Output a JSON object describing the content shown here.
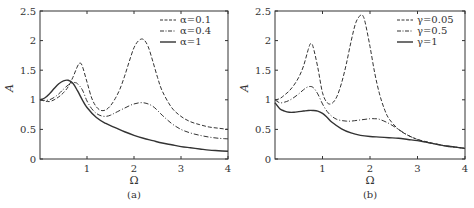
{
  "chart_data": [
    {
      "type": "line",
      "panel": "a",
      "caption": "(a)",
      "xlabel": "Ω",
      "ylabel": "A",
      "xlim": [
        0,
        4
      ],
      "ylim": [
        0,
        2.5
      ],
      "xticks": [
        "1",
        "2",
        "3",
        "4"
      ],
      "yticks": [
        "0",
        "0.5",
        "1",
        "1.5",
        "2",
        "2.5"
      ],
      "grid": false,
      "legend_position": "upper right",
      "series": [
        {
          "name": "α=0.1",
          "style": "dashed",
          "x": [
            0,
            0.1,
            0.2,
            0.3,
            0.4,
            0.5,
            0.6,
            0.7,
            0.8,
            0.85,
            0.9,
            1.0,
            1.1,
            1.2,
            1.3,
            1.4,
            1.5,
            1.6,
            1.7,
            1.8,
            1.9,
            2.0,
            2.1,
            2.2,
            2.3,
            2.4,
            2.5,
            2.6,
            2.8,
            3.0,
            3.2,
            3.4,
            3.6,
            3.8,
            4.0
          ],
          "y": [
            1.0,
            0.98,
            0.97,
            1.0,
            1.05,
            1.12,
            1.22,
            1.38,
            1.57,
            1.62,
            1.57,
            1.3,
            1.03,
            0.88,
            0.82,
            0.83,
            0.9,
            1.02,
            1.18,
            1.4,
            1.65,
            1.88,
            2.0,
            2.02,
            1.9,
            1.65,
            1.38,
            1.15,
            0.87,
            0.72,
            0.63,
            0.58,
            0.54,
            0.52,
            0.5
          ]
        },
        {
          "name": "α=0.4",
          "style": "dashdot",
          "x": [
            0,
            0.1,
            0.2,
            0.3,
            0.4,
            0.5,
            0.6,
            0.7,
            0.75,
            0.8,
            0.9,
            1.0,
            1.1,
            1.2,
            1.3,
            1.4,
            1.5,
            1.6,
            1.8,
            2.0,
            2.2,
            2.4,
            2.6,
            2.8,
            3.0,
            3.2,
            3.4,
            3.6,
            3.8,
            4.0
          ],
          "y": [
            1.0,
            0.99,
            1.0,
            1.04,
            1.1,
            1.18,
            1.25,
            1.29,
            1.29,
            1.27,
            1.17,
            0.98,
            0.85,
            0.77,
            0.73,
            0.72,
            0.74,
            0.78,
            0.86,
            0.93,
            0.95,
            0.89,
            0.74,
            0.6,
            0.5,
            0.44,
            0.4,
            0.37,
            0.35,
            0.34
          ]
        },
        {
          "name": "α=1",
          "style": "solid",
          "x": [
            0,
            0.1,
            0.2,
            0.3,
            0.4,
            0.5,
            0.6,
            0.7,
            0.8,
            0.9,
            1.0,
            1.2,
            1.4,
            1.6,
            1.8,
            2.0,
            2.2,
            2.4,
            2.6,
            2.8,
            3.0,
            3.2,
            3.4,
            3.6,
            3.8,
            4.0
          ],
          "y": [
            1.0,
            1.03,
            1.1,
            1.19,
            1.27,
            1.32,
            1.33,
            1.28,
            1.15,
            1.0,
            0.87,
            0.7,
            0.6,
            0.53,
            0.46,
            0.4,
            0.35,
            0.31,
            0.27,
            0.24,
            0.21,
            0.19,
            0.17,
            0.15,
            0.14,
            0.13
          ]
        }
      ]
    },
    {
      "type": "line",
      "panel": "b",
      "caption": "(b)",
      "xlabel": "Ω",
      "ylabel": "A",
      "xlim": [
        0,
        4
      ],
      "ylim": [
        0,
        2.5
      ],
      "xticks": [
        "1",
        "2",
        "3",
        "4"
      ],
      "yticks": [
        "0",
        "0.5",
        "1",
        "1.5",
        "2",
        "2.5"
      ],
      "grid": false,
      "legend_position": "upper right",
      "series": [
        {
          "name": "γ=0.05",
          "style": "dashed",
          "x": [
            0,
            0.1,
            0.2,
            0.3,
            0.4,
            0.5,
            0.6,
            0.7,
            0.75,
            0.8,
            0.9,
            1.0,
            1.1,
            1.2,
            1.3,
            1.4,
            1.5,
            1.6,
            1.7,
            1.8,
            1.85,
            1.9,
            2.0,
            2.1,
            2.2,
            2.3,
            2.4,
            2.6,
            2.8,
            3.0,
            3.2,
            3.4,
            3.6,
            3.8,
            4.0
          ],
          "y": [
            1.0,
            1.02,
            1.08,
            1.15,
            1.25,
            1.38,
            1.57,
            1.85,
            1.95,
            1.9,
            1.55,
            1.12,
            0.95,
            0.94,
            1.05,
            1.28,
            1.6,
            1.98,
            2.3,
            2.43,
            2.42,
            2.3,
            1.9,
            1.45,
            1.1,
            0.85,
            0.68,
            0.5,
            0.4,
            0.33,
            0.29,
            0.25,
            0.22,
            0.2,
            0.18
          ]
        },
        {
          "name": "γ=0.5",
          "style": "dashdot",
          "x": [
            0,
            0.1,
            0.2,
            0.3,
            0.4,
            0.5,
            0.6,
            0.7,
            0.8,
            0.9,
            1.0,
            1.1,
            1.2,
            1.3,
            1.4,
            1.5,
            1.6,
            1.8,
            2.0,
            2.1,
            2.2,
            2.4,
            2.6,
            2.8,
            3.0,
            3.2,
            3.4,
            3.6,
            3.8,
            4.0
          ],
          "y": [
            1.0,
            0.95,
            0.96,
            0.99,
            1.04,
            1.1,
            1.17,
            1.22,
            1.21,
            1.1,
            0.93,
            0.8,
            0.72,
            0.67,
            0.65,
            0.64,
            0.64,
            0.66,
            0.68,
            0.68,
            0.67,
            0.6,
            0.5,
            0.4,
            0.33,
            0.28,
            0.25,
            0.22,
            0.2,
            0.18
          ]
        },
        {
          "name": "γ=1",
          "style": "solid",
          "x": [
            0,
            0.1,
            0.2,
            0.3,
            0.4,
            0.5,
            0.6,
            0.7,
            0.8,
            0.9,
            1.0,
            1.1,
            1.2,
            1.4,
            1.6,
            1.8,
            2.0,
            2.2,
            2.4,
            2.6,
            2.8,
            3.0,
            3.2,
            3.4,
            3.6,
            3.8,
            4.0
          ],
          "y": [
            0.95,
            0.85,
            0.81,
            0.79,
            0.79,
            0.8,
            0.81,
            0.82,
            0.82,
            0.81,
            0.77,
            0.7,
            0.62,
            0.51,
            0.44,
            0.4,
            0.38,
            0.37,
            0.36,
            0.35,
            0.33,
            0.31,
            0.28,
            0.25,
            0.22,
            0.2,
            0.18
          ]
        }
      ]
    }
  ],
  "panels": {
    "a": {
      "caption": "(a)",
      "xlabel": "Ω",
      "ylabel": "A",
      "legend": [
        "α=0.1",
        "α=0.4",
        "α=1"
      ]
    },
    "b": {
      "caption": "(b)",
      "xlabel": "Ω",
      "ylabel": "A",
      "legend": [
        "γ=0.05",
        "γ=0.5",
        "γ=1"
      ]
    }
  }
}
